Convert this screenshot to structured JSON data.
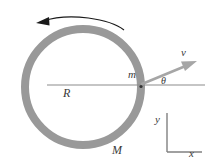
{
  "figure": {
    "colors": {
      "ring_gray": "#999999",
      "arrow_gray": "#a6a6a6",
      "line_gray": "#8c8c8c",
      "axis_gray": "#808080",
      "rotation_arrow": "#1a1a1a",
      "text": "#3a3a3a",
      "background": "#ffffff"
    },
    "ring": {
      "label": "M",
      "center_x": 83,
      "center_y": 87,
      "radius": 58,
      "thickness": 8
    },
    "radius_line": {
      "label": "R",
      "from_x": 47,
      "to_x": 205,
      "y": 85
    },
    "bead": {
      "label": "m",
      "x": 141,
      "y": 85
    },
    "velocity_arrow": {
      "label": "v",
      "from_x": 142,
      "from_y": 84,
      "to_x": 197,
      "to_y": 61
    },
    "angle": {
      "label": "θ"
    },
    "rotation_arrow": {
      "direction": "counterclockwise",
      "start_x": 124,
      "start_y": 29,
      "end_x": 39,
      "end_y": 21
    },
    "axes": {
      "y_label": "y",
      "x_label": "x",
      "origin_x": 167,
      "origin_y": 152,
      "top_y": 113,
      "right_x": 202
    }
  }
}
